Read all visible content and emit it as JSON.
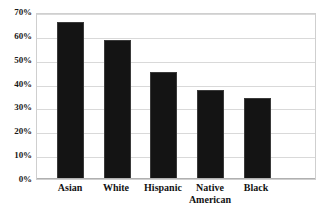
{
  "chart_data": {
    "type": "bar",
    "title": "",
    "subtitle": "",
    "xlabel": "",
    "ylabel": "",
    "categories": [
      "Asian",
      "White",
      "Hispanic",
      "Native\nAmerican",
      "Black"
    ],
    "values": [
      65.7,
      58.2,
      44.8,
      37.2,
      33.9
    ],
    "ylim": [
      0,
      70
    ],
    "ytick_labels": [
      "70%",
      "60%",
      "50%",
      "40%",
      "30%",
      "20%",
      "10%",
      "0%"
    ],
    "ytick_values": [
      70,
      60,
      50,
      40,
      30,
      20,
      10,
      0
    ],
    "grid": true,
    "legend": false,
    "legend_position": "none",
    "bar_color": "#141414",
    "grid_color": "#d9d9d9",
    "axis_color": "#b0b0b0",
    "plot_border_color": "#cfcfcf",
    "text_color": "#121212",
    "background": "#ffffff"
  }
}
